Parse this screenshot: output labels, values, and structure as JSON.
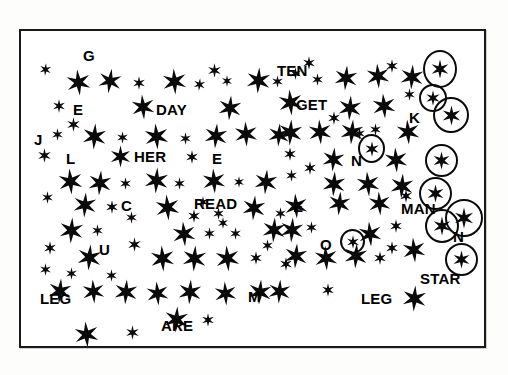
{
  "document": {
    "kind": "star-field-counting-worksheet",
    "frame": {
      "x": 19,
      "y": 29,
      "width": 467,
      "height": 319,
      "border_color": "#1a1a1a",
      "border_width": 2
    },
    "page_background": "#fdfdfc",
    "field_background": "#ffffff",
    "ink_color": "#0a0a0a"
  },
  "labels": [
    {
      "text": "G",
      "x": 62,
      "y": 17,
      "size": 15
    },
    {
      "text": "E",
      "x": 52,
      "y": 71,
      "size": 15
    },
    {
      "text": "DAY",
      "x": 135,
      "y": 71,
      "size": 15
    },
    {
      "text": "J",
      "x": 13,
      "y": 101,
      "size": 15
    },
    {
      "text": "L",
      "x": 45,
      "y": 120,
      "size": 15
    },
    {
      "text": "HER",
      "x": 113,
      "y": 118,
      "size": 15
    },
    {
      "text": "E",
      "x": 191,
      "y": 120,
      "size": 15
    },
    {
      "text": "C",
      "x": 100,
      "y": 167,
      "size": 15
    },
    {
      "text": "READ",
      "x": 173,
      "y": 165,
      "size": 15
    },
    {
      "text": "U",
      "x": 78,
      "y": 211,
      "size": 15
    },
    {
      "text": "LEG",
      "x": 19,
      "y": 260,
      "size": 15
    },
    {
      "text": "ARE",
      "x": 140,
      "y": 287,
      "size": 15
    },
    {
      "text": "M",
      "x": 227,
      "y": 258,
      "size": 15
    },
    {
      "text": "TEN",
      "x": 256,
      "y": 32,
      "size": 15
    },
    {
      "text": "GET",
      "x": 275,
      "y": 66,
      "size": 15
    },
    {
      "text": "E",
      "x": 272,
      "y": 168,
      "size": 15
    },
    {
      "text": "O",
      "x": 299,
      "y": 206,
      "size": 15
    },
    {
      "text": "N",
      "x": 330,
      "y": 122,
      "size": 15
    },
    {
      "text": "LEG",
      "x": 340,
      "y": 260,
      "size": 15
    },
    {
      "text": "K",
      "x": 388,
      "y": 79,
      "size": 15
    },
    {
      "text": "MAN",
      "x": 380,
      "y": 170,
      "size": 15
    },
    {
      "text": "N",
      "x": 432,
      "y": 198,
      "size": 15
    },
    {
      "text": "STAR",
      "x": 399,
      "y": 240,
      "size": 15
    }
  ],
  "circled_stars": [
    {
      "x": 402,
      "y": 19,
      "w": 34,
      "h": 38
    },
    {
      "x": 398,
      "y": 53,
      "w": 28,
      "h": 28
    },
    {
      "x": 412,
      "y": 66,
      "w": 36,
      "h": 36
    },
    {
      "x": 404,
      "y": 113,
      "w": 33,
      "h": 33
    },
    {
      "x": 398,
      "y": 146,
      "w": 33,
      "h": 33
    },
    {
      "x": 404,
      "y": 178,
      "w": 34,
      "h": 34
    },
    {
      "x": 424,
      "y": 168,
      "w": 38,
      "h": 38
    },
    {
      "x": 424,
      "y": 212,
      "w": 33,
      "h": 33
    },
    {
      "x": 337,
      "y": 103,
      "w": 27,
      "h": 29
    },
    {
      "x": 319,
      "y": 198,
      "w": 25,
      "h": 25
    }
  ],
  "stars": [
    {
      "x": 18,
      "y": 32,
      "s": 13,
      "r": 5
    },
    {
      "x": 44,
      "y": 38,
      "s": 27,
      "r": -6
    },
    {
      "x": 76,
      "y": 37,
      "s": 26,
      "r": 8
    },
    {
      "x": 111,
      "y": 45,
      "s": 14,
      "r": 0
    },
    {
      "x": 140,
      "y": 37,
      "s": 27,
      "r": -4
    },
    {
      "x": 172,
      "y": 47,
      "s": 13,
      "r": 6
    },
    {
      "x": 186,
      "y": 32,
      "s": 15,
      "r": 0
    },
    {
      "x": 200,
      "y": 44,
      "s": 12,
      "r": 0
    },
    {
      "x": 224,
      "y": 36,
      "s": 27,
      "r": 4
    },
    {
      "x": 250,
      "y": 44,
      "s": 13,
      "r": 0
    },
    {
      "x": 31,
      "y": 68,
      "s": 14,
      "r": 0
    },
    {
      "x": 109,
      "y": 63,
      "s": 26,
      "r": -5
    },
    {
      "x": 196,
      "y": 64,
      "s": 26,
      "r": 5
    },
    {
      "x": 45,
      "y": 86,
      "s": 15,
      "r": 0
    },
    {
      "x": 30,
      "y": 97,
      "s": 13,
      "r": 0
    },
    {
      "x": 60,
      "y": 92,
      "s": 27,
      "r": 4
    },
    {
      "x": 95,
      "y": 100,
      "s": 13,
      "r": 0
    },
    {
      "x": 122,
      "y": 92,
      "s": 27,
      "r": -5
    },
    {
      "x": 158,
      "y": 101,
      "s": 13,
      "r": 0
    },
    {
      "x": 182,
      "y": 92,
      "s": 26,
      "r": 5
    },
    {
      "x": 212,
      "y": 90,
      "s": 26,
      "r": -3
    },
    {
      "x": 246,
      "y": 92,
      "s": 24,
      "r": 4
    },
    {
      "x": 16,
      "y": 117,
      "s": 15,
      "r": 0
    },
    {
      "x": 88,
      "y": 114,
      "s": 23,
      "r": 0
    },
    {
      "x": 164,
      "y": 119,
      "s": 14,
      "r": 0
    },
    {
      "x": 36,
      "y": 137,
      "s": 27,
      "r": -5
    },
    {
      "x": 66,
      "y": 139,
      "s": 26,
      "r": 5
    },
    {
      "x": 98,
      "y": 146,
      "s": 13,
      "r": 0
    },
    {
      "x": 122,
      "y": 136,
      "s": 27,
      "r": 4
    },
    {
      "x": 152,
      "y": 146,
      "s": 13,
      "r": 0
    },
    {
      "x": 180,
      "y": 137,
      "s": 26,
      "r": -4
    },
    {
      "x": 212,
      "y": 145,
      "s": 12,
      "r": 0
    },
    {
      "x": 232,
      "y": 138,
      "s": 26,
      "r": 5
    },
    {
      "x": 20,
      "y": 160,
      "s": 13,
      "r": 0
    },
    {
      "x": 51,
      "y": 161,
      "s": 26,
      "r": 4
    },
    {
      "x": 84,
      "y": 169,
      "s": 14,
      "r": 0
    },
    {
      "x": 104,
      "y": 180,
      "s": 13,
      "r": 0
    },
    {
      "x": 133,
      "y": 163,
      "s": 27,
      "r": -5
    },
    {
      "x": 166,
      "y": 178,
      "s": 14,
      "r": 0
    },
    {
      "x": 176,
      "y": 165,
      "s": 12,
      "r": 0
    },
    {
      "x": 191,
      "y": 176,
      "s": 13,
      "r": 0
    },
    {
      "x": 220,
      "y": 164,
      "s": 26,
      "r": 5
    },
    {
      "x": 253,
      "y": 176,
      "s": 13,
      "r": 0
    },
    {
      "x": 37,
      "y": 186,
      "s": 27,
      "r": 4
    },
    {
      "x": 70,
      "y": 193,
      "s": 13,
      "r": 0
    },
    {
      "x": 150,
      "y": 190,
      "s": 26,
      "r": -5
    },
    {
      "x": 182,
      "y": 196,
      "s": 13,
      "r": 0
    },
    {
      "x": 196,
      "y": 186,
      "s": 12,
      "r": 0
    },
    {
      "x": 208,
      "y": 196,
      "s": 13,
      "r": 0
    },
    {
      "x": 240,
      "y": 186,
      "s": 26,
      "r": 4
    },
    {
      "x": 22,
      "y": 210,
      "s": 14,
      "r": 0
    },
    {
      "x": 55,
      "y": 213,
      "s": 27,
      "r": 5
    },
    {
      "x": 106,
      "y": 206,
      "s": 15,
      "r": 0
    },
    {
      "x": 128,
      "y": 214,
      "s": 27,
      "r": -4
    },
    {
      "x": 160,
      "y": 214,
      "s": 27,
      "r": 4
    },
    {
      "x": 193,
      "y": 214,
      "s": 27,
      "r": -5
    },
    {
      "x": 228,
      "y": 220,
      "s": 14,
      "r": 0
    },
    {
      "x": 240,
      "y": 208,
      "s": 13,
      "r": 0
    },
    {
      "x": 18,
      "y": 232,
      "s": 13,
      "r": 0
    },
    {
      "x": 44,
      "y": 236,
      "s": 13,
      "r": 0
    },
    {
      "x": 84,
      "y": 238,
      "s": 13,
      "r": 0
    },
    {
      "x": 258,
      "y": 226,
      "s": 14,
      "r": 0
    },
    {
      "x": 26,
      "y": 247,
      "s": 26,
      "r": 5
    },
    {
      "x": 60,
      "y": 248,
      "s": 25,
      "r": -4
    },
    {
      "x": 92,
      "y": 248,
      "s": 26,
      "r": 4
    },
    {
      "x": 124,
      "y": 250,
      "s": 25,
      "r": -5
    },
    {
      "x": 156,
      "y": 248,
      "s": 26,
      "r": 4
    },
    {
      "x": 192,
      "y": 250,
      "s": 25,
      "r": -4
    },
    {
      "x": 226,
      "y": 248,
      "s": 26,
      "r": 5
    },
    {
      "x": 142,
      "y": 275,
      "s": 27,
      "r": 4
    },
    {
      "x": 180,
      "y": 282,
      "s": 14,
      "r": 0
    },
    {
      "x": 52,
      "y": 290,
      "s": 27,
      "r": -5
    },
    {
      "x": 104,
      "y": 294,
      "s": 15,
      "r": 0
    },
    {
      "x": 268,
      "y": 36,
      "s": 13,
      "r": 0
    },
    {
      "x": 281,
      "y": 25,
      "s": 14,
      "r": 0
    },
    {
      "x": 290,
      "y": 42,
      "s": 13,
      "r": 0
    },
    {
      "x": 312,
      "y": 34,
      "s": 26,
      "r": 5
    },
    {
      "x": 344,
      "y": 32,
      "s": 26,
      "r": -4
    },
    {
      "x": 364,
      "y": 28,
      "s": 14,
      "r": 0
    },
    {
      "x": 378,
      "y": 33,
      "s": 26,
      "r": 4
    },
    {
      "x": 256,
      "y": 58,
      "s": 27,
      "r": -5
    },
    {
      "x": 316,
      "y": 64,
      "s": 26,
      "r": 4
    },
    {
      "x": 350,
      "y": 62,
      "s": 26,
      "r": -5
    },
    {
      "x": 382,
      "y": 57,
      "s": 13,
      "r": 0
    },
    {
      "x": 256,
      "y": 88,
      "s": 27,
      "r": 4
    },
    {
      "x": 286,
      "y": 88,
      "s": 26,
      "r": -4
    },
    {
      "x": 306,
      "y": 80,
      "s": 14,
      "r": 0
    },
    {
      "x": 318,
      "y": 88,
      "s": 26,
      "r": 5
    },
    {
      "x": 348,
      "y": 92,
      "s": 13,
      "r": 0
    },
    {
      "x": 332,
      "y": 96,
      "s": 13,
      "r": 0
    },
    {
      "x": 374,
      "y": 88,
      "s": 26,
      "r": -4
    },
    {
      "x": 262,
      "y": 116,
      "s": 14,
      "r": 0
    },
    {
      "x": 300,
      "y": 116,
      "s": 25,
      "r": 5
    },
    {
      "x": 362,
      "y": 116,
      "s": 26,
      "r": -4
    },
    {
      "x": 264,
      "y": 138,
      "s": 13,
      "r": 0
    },
    {
      "x": 282,
      "y": 130,
      "s": 14,
      "r": 0
    },
    {
      "x": 300,
      "y": 140,
      "s": 26,
      "r": 4
    },
    {
      "x": 334,
      "y": 140,
      "s": 26,
      "r": -5
    },
    {
      "x": 368,
      "y": 142,
      "s": 26,
      "r": 4
    },
    {
      "x": 262,
      "y": 162,
      "s": 26,
      "r": -4
    },
    {
      "x": 306,
      "y": 160,
      "s": 25,
      "r": 5
    },
    {
      "x": 346,
      "y": 160,
      "s": 25,
      "r": -4
    },
    {
      "x": 378,
      "y": 158,
      "s": 14,
      "r": 0
    },
    {
      "x": 258,
      "y": 186,
      "s": 26,
      "r": 4
    },
    {
      "x": 284,
      "y": 190,
      "s": 13,
      "r": 0
    },
    {
      "x": 336,
      "y": 190,
      "s": 26,
      "r": -5
    },
    {
      "x": 368,
      "y": 188,
      "s": 14,
      "r": 0
    },
    {
      "x": 262,
      "y": 212,
      "s": 26,
      "r": 5
    },
    {
      "x": 292,
      "y": 214,
      "s": 26,
      "r": -4
    },
    {
      "x": 322,
      "y": 212,
      "s": 26,
      "r": 4
    },
    {
      "x": 352,
      "y": 220,
      "s": 14,
      "r": 0
    },
    {
      "x": 364,
      "y": 210,
      "s": 14,
      "r": 0
    },
    {
      "x": 380,
      "y": 206,
      "s": 26,
      "r": -5
    },
    {
      "x": 300,
      "y": 252,
      "s": 14,
      "r": 0
    },
    {
      "x": 380,
      "y": 254,
      "s": 27,
      "r": 4
    },
    {
      "x": 246,
      "y": 248,
      "s": 25,
      "r": 4
    }
  ]
}
